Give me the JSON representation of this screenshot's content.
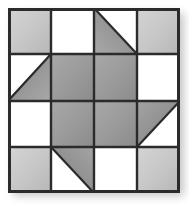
{
  "figure": {
    "type": "patchwork-quilt-block",
    "grid_rows": 4,
    "grid_cols": 4,
    "background_color": "#ffffff",
    "grid_line_color": "#2b2b2b",
    "grid_line_width": 2.5,
    "outer_border_color": "#2b2b2b",
    "outer_border_width": 3,
    "shadow_color": "#787878",
    "block_origin": {
      "x": 8,
      "y": 8
    },
    "block_size": {
      "width": 172,
      "height": 185
    }
  },
  "palette": {
    "white": "#ffffff",
    "light_gray": "#c9c9c9",
    "light_gray_edge": "#b4b4b4",
    "medium_gray": "#9a9a9a",
    "medium_gray_edge": "#8a8a8a",
    "dark_gray": "#7e7e7e",
    "line": "#2b2b2b"
  },
  "legend": {
    "fill_names": [
      "white",
      "light-gray",
      "medium-gray"
    ],
    "shape_names": [
      "square",
      "half-square-triangle"
    ]
  },
  "chart_data": {
    "type": "heatmap",
    "xlabel": "",
    "ylabel": "",
    "categories": [
      "col-0",
      "col-1",
      "col-2",
      "col-3"
    ],
    "rows": [
      "row-0",
      "row-1",
      "row-2",
      "row-3"
    ],
    "cells": [
      {
        "row": 0,
        "col": 0,
        "shape": "square",
        "fill": "light-gray",
        "triangle": null,
        "value": 1
      },
      {
        "row": 0,
        "col": 1,
        "shape": "square",
        "fill": "white",
        "triangle": null,
        "value": 0
      },
      {
        "row": 0,
        "col": 2,
        "shape": "half-square-triangle",
        "fill": "medium-gray",
        "triangle": "lower-left",
        "value": 0.5
      },
      {
        "row": 0,
        "col": 3,
        "shape": "square",
        "fill": "light-gray",
        "triangle": null,
        "value": 1
      },
      {
        "row": 1,
        "col": 0,
        "shape": "half-square-triangle",
        "fill": "medium-gray",
        "triangle": "lower-right",
        "value": 0.5
      },
      {
        "row": 1,
        "col": 1,
        "shape": "square",
        "fill": "medium-gray",
        "triangle": null,
        "value": 2
      },
      {
        "row": 1,
        "col": 2,
        "shape": "square",
        "fill": "medium-gray",
        "triangle": null,
        "value": 2
      },
      {
        "row": 1,
        "col": 3,
        "shape": "square",
        "fill": "white",
        "triangle": null,
        "value": 0
      },
      {
        "row": 2,
        "col": 0,
        "shape": "square",
        "fill": "white",
        "triangle": null,
        "value": 0
      },
      {
        "row": 2,
        "col": 1,
        "shape": "square",
        "fill": "medium-gray",
        "triangle": null,
        "value": 2
      },
      {
        "row": 2,
        "col": 2,
        "shape": "square",
        "fill": "medium-gray",
        "triangle": null,
        "value": 2
      },
      {
        "row": 2,
        "col": 3,
        "shape": "half-square-triangle",
        "fill": "medium-gray",
        "triangle": "upper-left",
        "value": 0.5
      },
      {
        "row": 3,
        "col": 0,
        "shape": "square",
        "fill": "light-gray",
        "triangle": null,
        "value": 1
      },
      {
        "row": 3,
        "col": 1,
        "shape": "half-square-triangle",
        "fill": "medium-gray",
        "triangle": "upper-right",
        "value": 0.5
      },
      {
        "row": 3,
        "col": 2,
        "shape": "square",
        "fill": "white",
        "triangle": null,
        "value": 0
      },
      {
        "row": 3,
        "col": 3,
        "shape": "square",
        "fill": "light-gray",
        "triangle": null,
        "value": 1
      }
    ],
    "grid": true,
    "legend_position": "none"
  }
}
